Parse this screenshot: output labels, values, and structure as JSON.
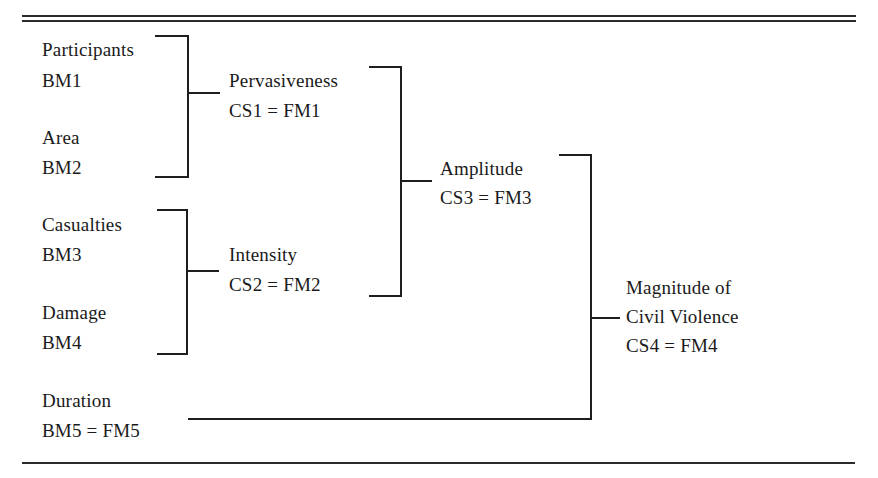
{
  "diagram": {
    "base_measures": [
      {
        "name": "Participants",
        "code": "BM1"
      },
      {
        "name": "Area",
        "code": "BM2"
      },
      {
        "name": "Casualties",
        "code": "BM3"
      },
      {
        "name": "Damage",
        "code": "BM4"
      },
      {
        "name": "Duration",
        "code": "BM5 = FM5"
      }
    ],
    "composites": [
      {
        "name": "Pervasiveness",
        "code": "CS1 = FM1",
        "inputs": [
          "BM1",
          "BM2"
        ]
      },
      {
        "name": "Intensity",
        "code": "CS2 = FM2",
        "inputs": [
          "BM3",
          "BM4"
        ]
      },
      {
        "name": "Amplitude",
        "code": "CS3 = FM3",
        "inputs": [
          "CS1",
          "CS2"
        ]
      }
    ],
    "final": {
      "name_line1": "Magnitude of",
      "name_line2": "Civil Violence",
      "code": "CS4 = FM4",
      "inputs": [
        "CS3",
        "BM5"
      ]
    }
  }
}
